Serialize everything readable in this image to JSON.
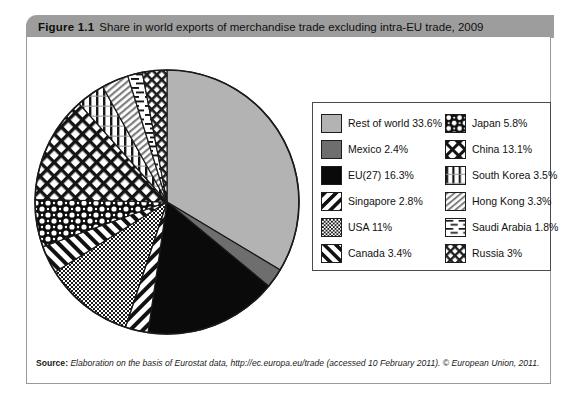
{
  "figure": {
    "number": "Figure 1.1",
    "title": "Share in world exports of merchandise trade excluding intra-EU trade, 2009"
  },
  "source": {
    "label": "Source:",
    "text": "Elaboration on the basis of Eurostat data, http://ec.europa.eu/trade (accessed 10 February 2011). © European Union, 2011."
  },
  "legend": {
    "left_column": [
      {
        "label": "Rest of world 33.6%",
        "pattern": "solid-light-gray"
      },
      {
        "label": "Mexico 2.4%",
        "pattern": "solid-dark-gray"
      },
      {
        "label": "EU(27) 16.3%",
        "pattern": "solid-black"
      },
      {
        "label": "Singapore 2.8%",
        "pattern": "diagonal-stripes-back"
      },
      {
        "label": "USA 11%",
        "pattern": "fine-checker"
      },
      {
        "label": "Canada 3.4%",
        "pattern": "diagonal-stripes-fwd"
      }
    ],
    "right_column": [
      {
        "label": "Japan 5.8%",
        "pattern": "bold-checker"
      },
      {
        "label": "China 13.1%",
        "pattern": "cross-diagonal"
      },
      {
        "label": "South Korea 3.5%",
        "pattern": "vertical-lines"
      },
      {
        "label": "Hong Kong 3.3%",
        "pattern": "fine-diagonal-gray"
      },
      {
        "label": "Saudi Arabia 1.8%",
        "pattern": "dashed-horizontal"
      },
      {
        "label": "Russia 3%",
        "pattern": "dense-cross-diagonal"
      }
    ]
  },
  "chart_data": {
    "type": "pie",
    "title": "Share in world exports of merchandise trade excluding intra-EU trade, 2009",
    "unit": "%",
    "start_angle_deg": -90,
    "direction": "clockwise",
    "legend_position": "right",
    "categories": [
      "Rest of world",
      "Mexico",
      "EU(27)",
      "Singapore",
      "USA",
      "Canada",
      "Japan",
      "China",
      "South Korea",
      "Hong Kong",
      "Saudi Arabia",
      "Russia"
    ],
    "values": [
      33.6,
      2.4,
      16.3,
      2.8,
      11,
      3.4,
      5.8,
      13.1,
      3.5,
      3.3,
      1.8,
      3
    ],
    "slices": [
      {
        "label": "Rest of world",
        "value": 33.6,
        "pattern": "solid-light-gray",
        "fill": "#b3b3b3"
      },
      {
        "label": "Mexico",
        "value": 2.4,
        "pattern": "solid-dark-gray",
        "fill": "#6e6e6e"
      },
      {
        "label": "EU(27)",
        "value": 16.3,
        "pattern": "solid-black",
        "fill": "#0a0a0a"
      },
      {
        "label": "Singapore",
        "value": 2.8,
        "pattern": "diagonal-stripes-back",
        "fill": "#ffffff"
      },
      {
        "label": "USA",
        "value": 11,
        "pattern": "fine-checker",
        "fill": "#ffffff"
      },
      {
        "label": "Canada",
        "value": 3.4,
        "pattern": "diagonal-stripes-fwd",
        "fill": "#ffffff"
      },
      {
        "label": "Japan",
        "value": 5.8,
        "pattern": "bold-checker",
        "fill": "#ffffff"
      },
      {
        "label": "China",
        "value": 13.1,
        "pattern": "cross-diagonal",
        "fill": "#ffffff"
      },
      {
        "label": "South Korea",
        "value": 3.5,
        "pattern": "vertical-lines",
        "fill": "#ffffff"
      },
      {
        "label": "Hong Kong",
        "value": 3.3,
        "pattern": "fine-diagonal-gray",
        "fill": "#ffffff"
      },
      {
        "label": "Saudi Arabia",
        "value": 1.8,
        "pattern": "dashed-horizontal",
        "fill": "#ffffff"
      },
      {
        "label": "Russia",
        "value": 3,
        "pattern": "dense-cross-diagonal",
        "fill": "#ffffff"
      }
    ]
  },
  "colors": {
    "title_bar": "#9d9d9d",
    "frame_border": "#9a9a9a",
    "legend_border": "#4a4a4a",
    "text": "#111111"
  }
}
